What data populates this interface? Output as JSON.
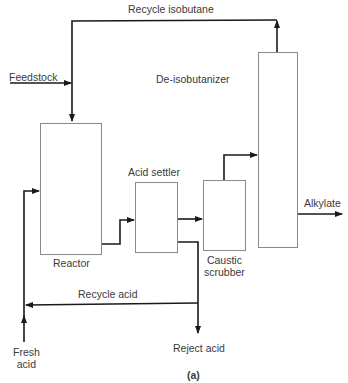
{
  "diagram": {
    "title": "(a)",
    "units": [
      {
        "id": "reactor",
        "label": "Reactor"
      },
      {
        "id": "acid-settler",
        "label": "Acid settler"
      },
      {
        "id": "caustic-scrubber",
        "label_line1": "Caustic",
        "label_line2": "scrubber"
      },
      {
        "id": "de-isobutanizer",
        "label": "De-isobutanizer"
      }
    ],
    "streams": {
      "recycle_isobutane": "Recycle isobutane",
      "feedstock": "Feedstock",
      "alkylate": "Alkylate",
      "recycle_acid": "Recycle acid",
      "reject_acid": "Reject acid",
      "fresh_acid_line1": "Fresh",
      "fresh_acid_line2": "acid"
    },
    "colors": {
      "line": "#1a1a1a",
      "box": "#8a8a8a",
      "text": "#3a3a3a"
    }
  }
}
